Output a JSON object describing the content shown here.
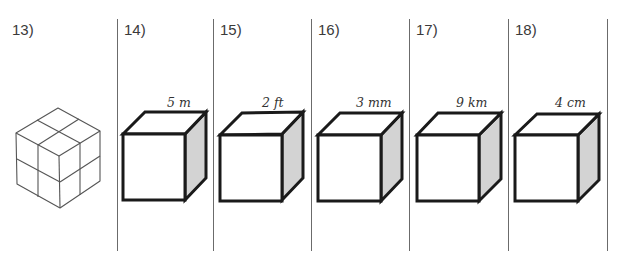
{
  "worksheet": {
    "problems": [
      {
        "number": "13)",
        "figure": "isometric-2x2x2-cube",
        "label": ""
      },
      {
        "number": "14)",
        "figure": "cube",
        "label": "5 m"
      },
      {
        "number": "15)",
        "figure": "cube",
        "label": "2 ft"
      },
      {
        "number": "16)",
        "figure": "cube",
        "label": "3 mm"
      },
      {
        "number": "17)",
        "figure": "cube",
        "label": "9 km"
      },
      {
        "number": "18)",
        "figure": "cube",
        "label": "4 cm"
      }
    ],
    "colors": {
      "cube_outline": "#1a1a1a",
      "cube_side_shade": "#d3d3d3",
      "divider": "#6b6b6b",
      "iso_grid": "#555555"
    }
  }
}
